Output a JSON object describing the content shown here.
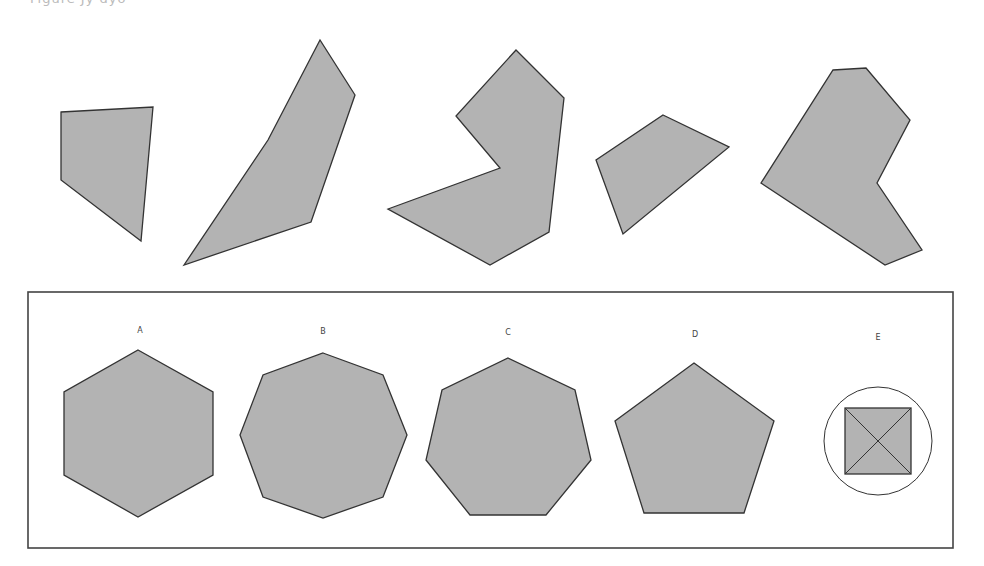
{
  "caption_partial": "Figure  Jy  dyo",
  "colors": {
    "fill": "#b3b3b3",
    "stroke": "#333333",
    "box_border": "#444444",
    "background": "#ffffff"
  },
  "question_sequence": {
    "description": "Five irregular polygons forming a sequence",
    "shapes": [
      {
        "id": "q1",
        "sides": 4,
        "points": "61,112 153,107 141,241 61,180"
      },
      {
        "id": "q2",
        "sides": 5,
        "points": "184,265 268,140 320,40 355,95 311,222"
      },
      {
        "id": "q3",
        "sides": 7,
        "points": "516,50 564,98 549,232 490,265 388,209 500,168 456,116"
      },
      {
        "id": "q4",
        "sides": 4,
        "points": "663,115 729,147 623,234 596,160"
      },
      {
        "id": "q5",
        "sides": 7,
        "points": "833,70 866,68 910,120 877,183 922,250 885,265 761,183"
      }
    ]
  },
  "answer_box": {
    "x": 28,
    "y": 292,
    "width": 925,
    "height": 256,
    "options": [
      {
        "label": "A",
        "shape": "hexagon",
        "label_x": 140,
        "label_y": 326,
        "points": "138,350 213,392 213,475 138,517 64,475 64,392"
      },
      {
        "label": "B",
        "shape": "octagon",
        "label_x": 323,
        "label_y": 327,
        "points": "323,353 383,375 407,435 383,497 323,518 263,497 240,435 263,375"
      },
      {
        "label": "C",
        "shape": "heptagon",
        "label_x": 508,
        "label_y": 328,
        "points": "508,358 575,390 591,460 546,515 470,515 426,460 442,390"
      },
      {
        "label": "D",
        "shape": "pentagon",
        "label_x": 695,
        "label_y": 330,
        "points": "694,363 774,421 744,513 644,513 615,421"
      },
      {
        "label": "E",
        "shape": "square-in-circle",
        "label_x": 878,
        "label_y": 333,
        "circle": {
          "cx": 878,
          "cy": 441,
          "r": 54
        },
        "square": {
          "x": 845,
          "y": 408,
          "size": 66
        }
      }
    ]
  }
}
